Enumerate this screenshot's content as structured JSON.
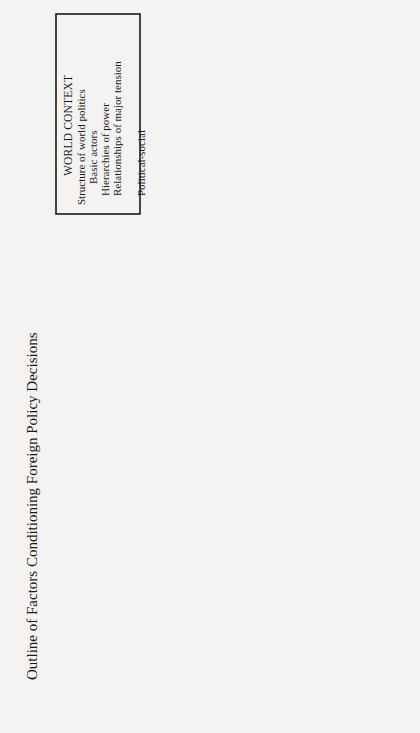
{
  "title": "Outline of Factors Conditioning Foreign Policy Decisions",
  "boxes": {
    "world_context": {
      "heading": "WORLD CONTEXT",
      "lines": [
        "Structure of world politics",
        "Basic actors",
        "Hierarchies of power",
        "Relationships of major tension",
        "Transnational forces",
        "Political-social",
        "Economic-technological"
      ]
    },
    "material_interests": {
      "heading": "MATERIAL INTERESTS OF GROUP",
      "lines": [
        "Military strategic",
        "Economic-social",
        "Political, external and",
        "internal"
      ]
    },
    "sentiments": {
      "heading": "SENTIMENTS AND IDEAS",
      "lines": [
        "Nationalism, ideology",
        "Other extrapersonal values"
      ]
    },
    "extrapersonal": {
      "heading1": "EXTRAPERSONAL",
      "heading2": "CONSIDERATIONS",
      "lines": [
        "Related to Party, to the",
        "nation, or to transnational",
        "movements"
      ]
    },
    "culture": {
      "heading": "CULTURE",
      "lines": [
        "Way of life,",
        "history, and",
        "language"
      ]
    },
    "personal_factors": {
      "heading": "PERSONAL FACTORS"
    },
    "personality": {
      "heading": "PERSONALITY",
      "lines": [
        "Style, moods (security vs. anxiety)",
        "Mode of perception and decision,",
        "experiences"
      ]
    },
    "personal_interests": {
      "heading": "PERSONAL INTERESTS",
      "lines": [
        "Career; security; income;",
        "place in history"
      ]
    },
    "decision_makers": {
      "lines": [
        "THE",
        "DECISION",
        "MAKER (S)"
      ]
    },
    "problems": {
      "heading": "PROBLEMS"
    },
    "attention": {
      "lines": [
        "ATTENTION",
        "FRAME;",
        "PERCEPTION"
      ]
    },
    "decision": {
      "lines": [
        "THE",
        "DECISION"
      ]
    },
    "external_env": {
      "lines": [
        "PROBLEMS",
        "AND",
        "OPPORTUNITIES",
        "OF EXTERNAL",
        "ENVIRONMENT"
      ]
    },
    "domestic": {
      "heading1": "DOMESTIC",
      "heading2": "FACTORS",
      "lines": [
        "Economic",
        "Constitutional",
        "Political culture",
        "Communications",
        "networks"
      ]
    }
  },
  "labels": {
    "feedback": "Feedback",
    "interaction1": "Interaction and",
    "interaction2": "feedback"
  }
}
